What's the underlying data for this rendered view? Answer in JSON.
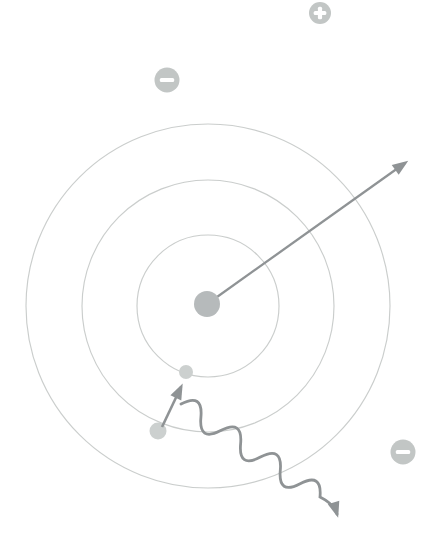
{
  "figure": {
    "type": "bohr-atom-diagram",
    "canvas": {
      "width": 441,
      "height": 550
    },
    "colors": {
      "background": "#ffffff",
      "shell": "#c7cac9",
      "nucleus": "#b6babb",
      "electron": "#ccd0cf",
      "ion": "#c2c6c5",
      "ion_sign": "#ffffff",
      "arrow": "#8f9395"
    },
    "atom": {
      "shells": {
        "cx": 208,
        "cy": 306,
        "radii": [
          71,
          126,
          182
        ]
      },
      "nucleus": {
        "cx": 207,
        "cy": 304,
        "r": 13
      },
      "electrons": [
        {
          "cx": 186,
          "cy": 372,
          "r": 7
        },
        {
          "cx": 158,
          "cy": 431,
          "r": 8.5
        }
      ]
    },
    "radial_arrow": {
      "x1": 210,
      "y1": 302,
      "x2": 405,
      "y2": 163
    },
    "transition_arrow": {
      "x1": 162,
      "y1": 427,
      "x2": 181,
      "y2": 387
    },
    "photon_wave": {
      "start": {
        "x": 181,
        "y": 404
      },
      "line_end": {
        "x": 320,
        "y": 497
      },
      "tail_ctrl": {
        "x": 334,
        "y": 504
      },
      "end": {
        "x": 337,
        "y": 514
      },
      "half_waves": 7,
      "amplitude": 11
    },
    "ions": [
      {
        "sign": "+",
        "cx": 320,
        "cy": 13,
        "r": 11
      },
      {
        "sign": "-",
        "cx": 167,
        "cy": 80,
        "r": 12.5
      },
      {
        "sign": "-",
        "cx": 403,
        "cy": 452,
        "r": 12.5
      }
    ]
  }
}
